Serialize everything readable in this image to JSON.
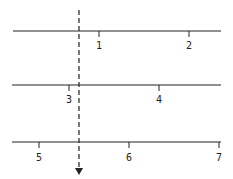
{
  "diagram": {
    "lines": [
      {
        "name": "row-1",
        "ticks": [
          {
            "label": "1"
          },
          {
            "label": "2"
          }
        ]
      },
      {
        "name": "row-2",
        "ticks": [
          {
            "label": "3"
          },
          {
            "label": "4"
          }
        ]
      },
      {
        "name": "row-3",
        "ticks": [
          {
            "label": "5"
          },
          {
            "label": "6"
          },
          {
            "label": "7"
          }
        ]
      }
    ],
    "colors": {
      "stroke": "#222222",
      "background": "#ffffff"
    }
  }
}
